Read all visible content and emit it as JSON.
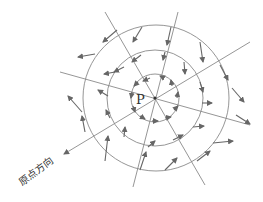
{
  "diagram": {
    "center_label": "P",
    "origin_direction_label": "原点方向",
    "colors": {
      "line": "#8a8a8a",
      "arrow": "#666666",
      "text": "#333333"
    },
    "center": [
      155,
      98
    ],
    "circle_radii": [
      24,
      48,
      73
    ],
    "radial_lines": [
      {
        "from": [
          105,
          12
        ],
        "to": [
          205,
          185
        ]
      },
      {
        "from": [
          178,
          12
        ],
        "to": [
          133,
          187
        ]
      },
      {
        "from": [
          60,
          72
        ],
        "to": [
          250,
          125
        ],
        "arrow_end": "both-partial"
      },
      {
        "from": [
          250,
          42
        ],
        "to": [
          63,
          155
        ],
        "arrow_end": "to"
      }
    ]
  }
}
